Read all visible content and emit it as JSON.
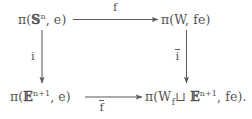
{
  "diagram": {
    "type": "commutative-square",
    "nodes": {
      "top_left": {
        "id": "pi-sphere",
        "text": "π(𝕊ⁿ, e)",
        "pi": "π",
        "open_paren": "(",
        "space_symbol": "𝕊",
        "space_exponent": "n",
        "basepoint": ", e",
        "close_paren": ")"
      },
      "top_right": {
        "id": "pi-W",
        "text": "π(W, fe)",
        "pi": "π",
        "open_paren": "(",
        "space_symbol": "W",
        "basepoint": ", fe",
        "close_paren": ")"
      },
      "bottom_left": {
        "id": "pi-disk",
        "text": "π(𝔼ⁿ⁺¹, e)",
        "pi": "π",
        "open_paren": "(",
        "space_symbol": "𝔼",
        "space_exponent": "n+1",
        "basepoint": ", e",
        "close_paren": ")"
      },
      "bottom_right": {
        "id": "pi-pushout",
        "text": "π(W ⊔f 𝔼ⁿ⁺¹, fe).",
        "pi": "π",
        "open_paren": "(",
        "space_symbol": "W",
        "union_subscript": "f",
        "union_symbol": "⊔",
        "attached_symbol": "𝔼",
        "attached_exponent": "n+1",
        "basepoint": ", fe",
        "close_paren": ")",
        "terminator": "."
      }
    },
    "edges": {
      "top": {
        "id": "edge-f",
        "label": "f",
        "from": "top_left",
        "to": "top_right",
        "direction": "right",
        "label_position": "above"
      },
      "bottom": {
        "id": "edge-f-bar",
        "label": "f",
        "label_overline": true,
        "from": "bottom_left",
        "to": "bottom_right",
        "direction": "right",
        "label_position": "below"
      },
      "left": {
        "id": "edge-i",
        "label": "i",
        "from": "top_left",
        "to": "bottom_left",
        "direction": "down",
        "label_position": "left"
      },
      "right": {
        "id": "edge-i-bar",
        "label": "i",
        "label_overline": true,
        "from": "top_right",
        "to": "bottom_right",
        "direction": "down",
        "label_position": "left"
      }
    },
    "colors": {
      "ink": "#555353",
      "rule": "#5b5959",
      "background": "#ffffff"
    }
  }
}
